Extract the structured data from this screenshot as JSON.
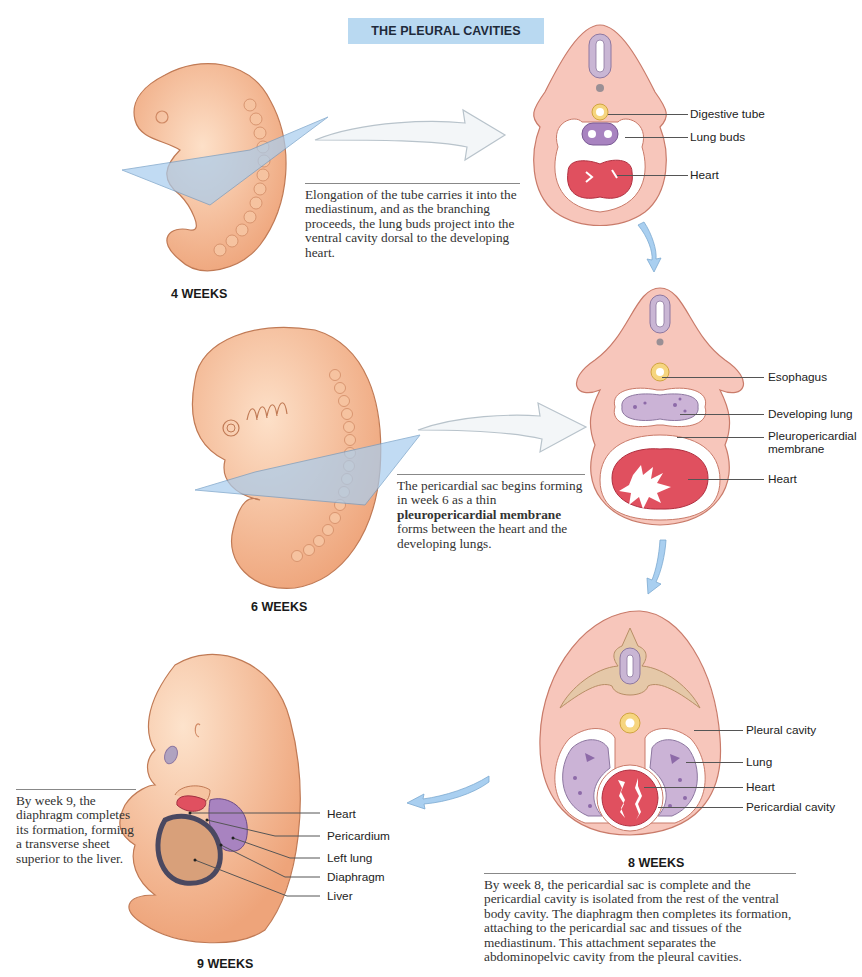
{
  "title": "THE PLEURAL CAVITIES",
  "colors": {
    "title_bg": "#b9d9f1",
    "embryo_skin": "#f4b990",
    "section_tissue": "#f7c6bb",
    "heart": "#e0505f",
    "lung": "#cbb3d6",
    "digestive_tube": "#f6d57f",
    "plane": "#a8cdef",
    "arrow_blue": "#a9cff0"
  },
  "stages": [
    {
      "id": "week4",
      "label": "4 WEEKS",
      "caption": "Elongation of the tube carries it into the mediastinum, and as the branching proceeds, the lung buds project into the ventral cavity dorsal to the developing heart.",
      "callouts": [
        "Digestive tube",
        "Lung buds",
        "Heart"
      ]
    },
    {
      "id": "week6",
      "label": "6 WEEKS",
      "caption_parts": {
        "pre": "The pericardial sac begins forming in week 6 as a thin ",
        "bold": "pleuropericardial membrane",
        "post": " forms between the heart and the developing lungs."
      },
      "callouts": [
        "Esophagus",
        "Developing lung",
        "Pleuropericardial membrane",
        "Heart"
      ]
    },
    {
      "id": "week8",
      "label": "8 WEEKS",
      "caption": "By week 8, the pericardial sac is complete and the pericardial cavity is isolated from the rest of the ventral body cavity. The diaphragm then completes its formation, attaching to the pericardial sac and tissues of the mediastinum. This attachment separates the abdominopelvic cavity from the pleural cavities.",
      "callouts": [
        "Pleural cavity",
        "Lung",
        "Heart",
        "Pericardial cavity"
      ]
    },
    {
      "id": "week9",
      "label": "9 WEEKS",
      "caption": "By week 9, the diaphragm completes its formation, forming a transverse sheet superior to the liver.",
      "callouts": [
        "Heart",
        "Pericardium",
        "Left lung",
        "Diaphragm",
        "Liver"
      ]
    }
  ]
}
